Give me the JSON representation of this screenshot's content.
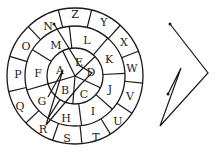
{
  "diagram": {
    "center": [
      75,
      76
    ],
    "radii": {
      "outer": 68,
      "middle": 50,
      "inner": 28
    },
    "outer_ring": {
      "letters": [
        "Z",
        "Y",
        "X",
        "W",
        "V",
        "U",
        "T",
        "S",
        "R",
        "Q",
        "P",
        "O",
        "N"
      ],
      "positions": [
        [
          75,
          14
        ],
        [
          104,
          22
        ],
        [
          124,
          42
        ],
        [
          132,
          68
        ],
        [
          130,
          96
        ],
        [
          118,
          121
        ],
        [
          96,
          137
        ],
        [
          67,
          138
        ],
        [
          43,
          129
        ],
        [
          20,
          106
        ],
        [
          18,
          74
        ],
        [
          26,
          46
        ],
        [
          48,
          26
        ]
      ]
    },
    "middle_ring": {
      "letters": [
        "L",
        "K",
        "J",
        "I",
        "H",
        "G",
        "F",
        "M"
      ],
      "positions": [
        [
          87,
          40
        ],
        [
          109,
          59
        ],
        [
          110,
          89
        ],
        [
          93,
          111
        ],
        [
          66,
          118
        ],
        [
          42,
          101
        ],
        [
          38,
          73
        ],
        [
          56,
          45
        ]
      ]
    },
    "inner_circle": {
      "letters": [
        "E",
        "D",
        "C",
        "B",
        "A"
      ],
      "positions": [
        [
          79,
          62
        ],
        [
          91,
          72
        ],
        [
          84,
          94
        ],
        [
          65,
          90
        ],
        [
          60,
          70
        ]
      ]
    },
    "wheel_path": {
      "description": "Line connecting letters inside wheel",
      "points": [
        [
          54,
          24
        ],
        [
          80,
          66
        ],
        [
          92,
          73
        ],
        [
          80,
          85
        ],
        [
          46,
          125
        ],
        [
          63,
          70
        ],
        [
          48,
          97
        ]
      ]
    },
    "extracted_shape": {
      "description": "Zigzag shape traced from the path",
      "points": [
        [
          170,
          24
        ],
        [
          208,
          73
        ],
        [
          160,
          126
        ],
        [
          181,
          68
        ],
        [
          168,
          94
        ]
      ]
    }
  }
}
